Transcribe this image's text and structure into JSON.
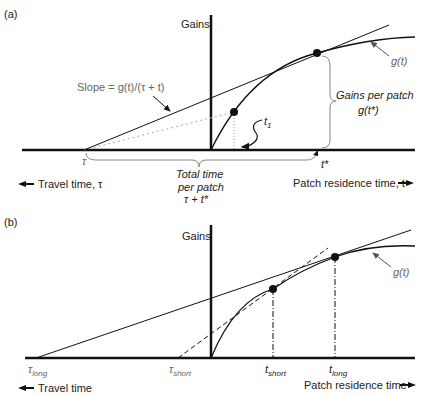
{
  "panel_a": {
    "label": "(a)",
    "y_axis_label": "Gains",
    "curve_label": "g(t)",
    "slope_label": "Slope = g(t)/(τ + t)",
    "t1_label": "t",
    "t1_sub": "1",
    "tau_label": "τ",
    "tstar_label": "t*",
    "gains_per_patch_line1": "Gains per patch",
    "gains_per_patch_line2": "g(t*)",
    "total_time_line1": "Total time",
    "total_time_line2": "per patch",
    "total_time_line3": "τ + t*",
    "travel_time_label": "Travel time, τ",
    "residence_time_label": "Patch residence time, t"
  },
  "panel_b": {
    "label": "(b)",
    "y_axis_label": "Gains",
    "curve_label": "g(t)",
    "tau_long": "τ",
    "tau_long_sub": "long",
    "tau_short": "τ",
    "tau_short_sub": "short",
    "t_short": "t",
    "t_short_sub": "short",
    "t_long": "t",
    "t_long_sub": "long",
    "travel_time_label": "Travel time",
    "residence_time_label": "Patch residence time"
  },
  "colors": {
    "line": "#111111",
    "annotation": "#777777",
    "dotted": "#aaaaaa"
  }
}
